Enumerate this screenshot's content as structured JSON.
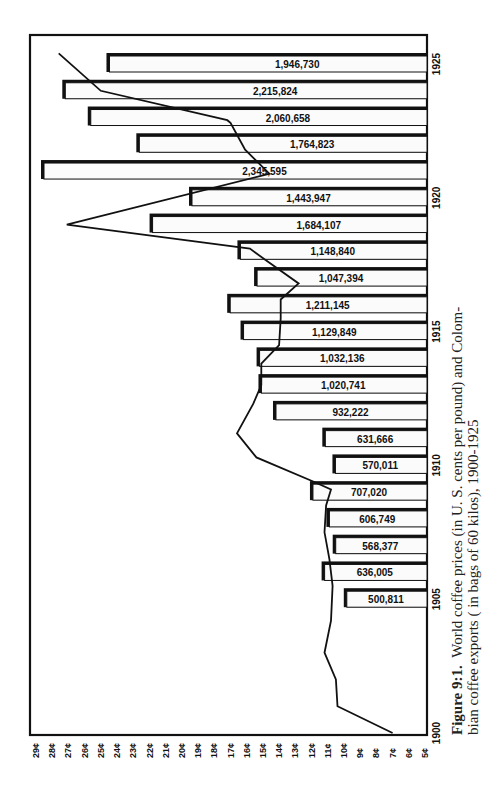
{
  "chart_data": {
    "type": "bar",
    "orientation": "rotated-90",
    "caption": {
      "label": "Figure 9:1.",
      "line1": "World coffee prices (in U. S. cents per pound) and Colom-",
      "line2": "bian coffee exports ( in bags of 60 kilos), 1900-1925"
    },
    "xlabel": "Year",
    "ylabel": "Price (U.S. cents per pound)",
    "price_ticks": [
      "29¢",
      "28¢",
      "27¢",
      "26¢",
      "25¢",
      "24¢",
      "23¢",
      "22¢",
      "21¢",
      "20¢",
      "19¢",
      "18¢",
      "17¢",
      "16¢",
      "15¢",
      "14¢",
      "13¢",
      "12¢",
      "11¢",
      "10¢",
      "9¢",
      "8¢",
      "7¢",
      "6¢",
      "5¢"
    ],
    "price_range": [
      5,
      29
    ],
    "year_ticks": [
      "1900",
      "1905",
      "1910",
      "1915",
      "1920",
      "1925"
    ],
    "year_range": [
      1900,
      1925
    ],
    "series": [
      {
        "name": "Colombian coffee exports (bags of 60 kilos)",
        "kind": "bar",
        "years": [
          1905,
          1906,
          1907,
          1908,
          1909,
          1910,
          1911,
          1912,
          1913,
          1914,
          1915,
          1916,
          1917,
          1918,
          1919,
          1920,
          1921,
          1922,
          1923,
          1924,
          1925
        ],
        "values": [
          500811,
          636005,
          568377,
          606749,
          707020,
          570011,
          631666,
          932222,
          1020741,
          1032136,
          1129849,
          1211145,
          1047394,
          1148840,
          1684107,
          1443947,
          2345595,
          1764823,
          2060658,
          2215824,
          1946730
        ],
        "labels": [
          "500,811",
          "636,005",
          "568,377",
          "606,749",
          "707,020",
          "570,011",
          "631,666",
          "932,222",
          "1,020,741",
          "1,032,136",
          "1,129,849",
          "1,211,145",
          "1,047,394",
          "1,148,840",
          "1,684,107",
          "1,443,947",
          "2,345,595",
          "1,764,823",
          "2,060,658",
          "2,215,824",
          "1,946,730"
        ]
      },
      {
        "name": "World coffee prices (U.S. cents per pound)",
        "kind": "line",
        "points": [
          {
            "year": 1900.0,
            "price": 7.0
          },
          {
            "year": 1901.0,
            "price": 10.4
          },
          {
            "year": 1902.0,
            "price": 10.5
          },
          {
            "year": 1903.0,
            "price": 11.2
          },
          {
            "year": 1904.2,
            "price": 10.8
          },
          {
            "year": 1905.5,
            "price": 10.7
          },
          {
            "year": 1906.5,
            "price": 10.9
          },
          {
            "year": 1907.5,
            "price": 11.2
          },
          {
            "year": 1908.5,
            "price": 11.1
          },
          {
            "year": 1909.1,
            "price": 10.8
          },
          {
            "year": 1909.4,
            "price": 11.9
          },
          {
            "year": 1910.3,
            "price": 15.4
          },
          {
            "year": 1911.2,
            "price": 16.6
          },
          {
            "year": 1912.3,
            "price": 15.6
          },
          {
            "year": 1913.0,
            "price": 15.1
          },
          {
            "year": 1913.8,
            "price": 15.1
          },
          {
            "year": 1914.5,
            "price": 14.0
          },
          {
            "year": 1915.5,
            "price": 13.9
          },
          {
            "year": 1916.2,
            "price": 13.9
          },
          {
            "year": 1916.8,
            "price": 12.8
          },
          {
            "year": 1917.7,
            "price": 14.9
          },
          {
            "year": 1918.1,
            "price": 15.8
          },
          {
            "year": 1919.0,
            "price": 27.1
          },
          {
            "year": 1920.9,
            "price": 14.6
          },
          {
            "year": 1921.8,
            "price": 16.1
          },
          {
            "year": 1922.8,
            "price": 17.0
          },
          {
            "year": 1922.9,
            "price": 17.2
          },
          {
            "year": 1924.0,
            "price": 25.0
          },
          {
            "year": 1925.4,
            "price": 27.6
          }
        ]
      }
    ],
    "grid": false,
    "legend": "none"
  },
  "style": {
    "ink": "#111111",
    "paper": "#ffffff",
    "bar_fill": "#fbfbfb"
  }
}
